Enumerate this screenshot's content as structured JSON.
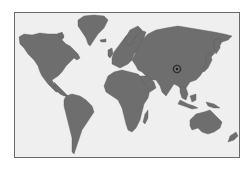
{
  "map": {
    "type": "world-map",
    "projection": "equirectangular-style",
    "colors": {
      "land": "#6e6e6e",
      "ocean": "#efefef",
      "border": "#6a6a6a",
      "marker": "#3a3a3a"
    },
    "continents": [
      "North America",
      "Greenland",
      "South America",
      "Europe",
      "Africa",
      "Asia",
      "Australia",
      "New Zealand",
      "Madagascar",
      "Japan",
      "Indonesia"
    ],
    "marker": {
      "icon": "location-marker-icon",
      "region": "Central Asia / Western China",
      "x": 177,
      "y": 69
    }
  }
}
